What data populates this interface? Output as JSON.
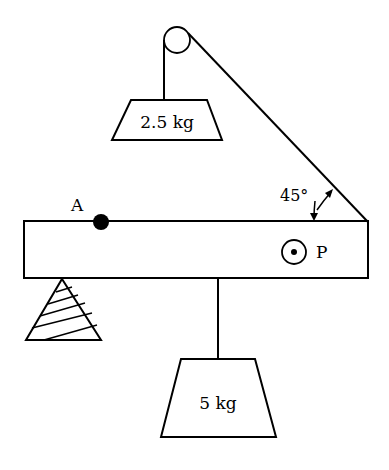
{
  "diagram": {
    "labels": {
      "point_a": "A",
      "point_p": "P",
      "angle": "45°",
      "upper_mass": "2.5 kg",
      "lower_mass": "5 kg"
    },
    "colors": {
      "stroke": "#000000",
      "background": "#ffffff"
    }
  }
}
